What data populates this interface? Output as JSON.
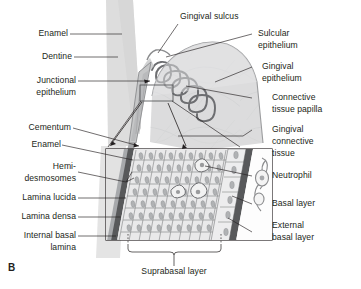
{
  "figure": {
    "panel_letter": "B",
    "colors": {
      "ink": "#231f20",
      "leader": "#58595b",
      "tooth_fill": "#d9d9d9",
      "gingiva_fill": "#d4d5d6",
      "epithelium_outline": "#6d6e71",
      "basal_lamina": "#6d6e71",
      "cell_fill": "#e8e8e8",
      "nucleus_fill": "#a7a9ac",
      "box_stroke": "#231f20"
    }
  },
  "labels_left": [
    {
      "id": "enamel-top",
      "text": [
        "Enamel"
      ]
    },
    {
      "id": "dentine",
      "text": [
        "Dentine"
      ]
    },
    {
      "id": "junctional",
      "text": [
        "Junctional",
        "epithelium"
      ]
    },
    {
      "id": "cementum",
      "text": [
        "Cementum"
      ]
    },
    {
      "id": "enamel-inset",
      "text": [
        "Enamel"
      ]
    },
    {
      "id": "hemidesmosomes",
      "text": [
        "Hemi-",
        "desmosomes"
      ]
    },
    {
      "id": "lamina-lucida",
      "text": [
        "Lamina lucida"
      ]
    },
    {
      "id": "lamina-densa",
      "text": [
        "Lamina densa"
      ]
    },
    {
      "id": "internal-basal",
      "text": [
        "Internal basal",
        "lamina"
      ]
    }
  ],
  "labels_right": [
    {
      "id": "sulcular",
      "text": [
        "Sulcular",
        "epithelium"
      ]
    },
    {
      "id": "gingival-epi",
      "text": [
        "Gingival",
        "epithelium"
      ]
    },
    {
      "id": "connective-pap",
      "text": [
        "Connective",
        "tissue papilla"
      ]
    },
    {
      "id": "gingival-ct",
      "text": [
        "Gingival",
        "connective",
        "tissue"
      ]
    },
    {
      "id": "neutrophil",
      "text": [
        "Neutrophil"
      ]
    },
    {
      "id": "basal-layer",
      "text": [
        "Basal layer"
      ]
    },
    {
      "id": "external-basal",
      "text": [
        "External",
        "basal layer"
      ]
    }
  ],
  "labels_top": [
    {
      "id": "gingival-sulcus",
      "text": [
        "Gingival sulcus"
      ]
    }
  ],
  "labels_bottom": [
    {
      "id": "suprabasal",
      "text": [
        "Suprabasal layer"
      ]
    }
  ],
  "text": {
    "enamel_top": "Enamel",
    "dentine": "Dentine",
    "junctional_1": "Junctional",
    "junctional_2": "epithelium",
    "cementum": "Cementum",
    "enamel_inset": "Enamel",
    "hemi_1": "Hemi-",
    "hemi_2": "desmosomes",
    "lamina_lucida": "Lamina lucida",
    "lamina_densa": "Lamina densa",
    "internal_basal_1": "Internal basal",
    "internal_basal_2": "lamina",
    "gingival_sulcus": "Gingival sulcus",
    "sulcular_1": "Sulcular",
    "sulcular_2": "epithelium",
    "gingival_epi_1": "Gingival",
    "gingival_epi_2": "epithelium",
    "connective_1": "Connective",
    "connective_2": "tissue papilla",
    "gingival_ct_1": "Gingival",
    "gingival_ct_2": "connective",
    "gingival_ct_3": "tissue",
    "neutrophil": "Neutrophil",
    "basal_layer": "Basal layer",
    "external_1": "External",
    "external_2": "basal layer",
    "suprabasal": "Suprabasal layer",
    "panel_b": "B"
  }
}
